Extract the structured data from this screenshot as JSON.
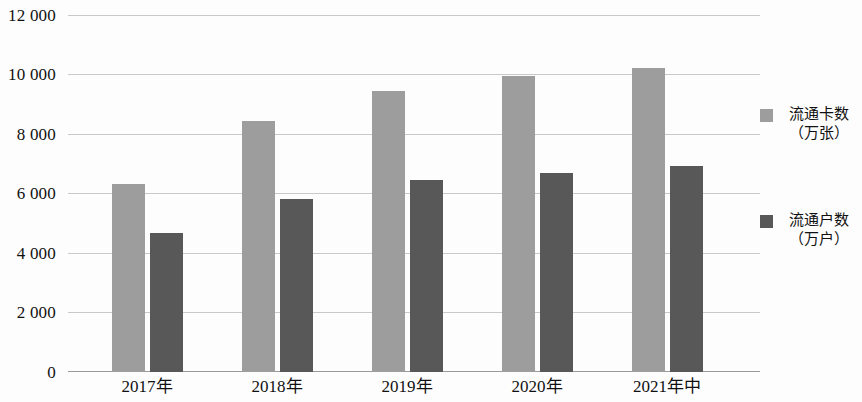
{
  "chart_data": {
    "type": "bar",
    "title": "",
    "subtitle": "",
    "xlabel": "",
    "ylabel": "",
    "categories": [
      "2017年",
      "2018年",
      "2019年",
      "2020年",
      "2021年中"
    ],
    "series": [
      {
        "name": "流通卡数（万张）",
        "name_line1": "流通卡数",
        "name_line2": "（万张）",
        "color": "#9d9d9d",
        "values": [
          6330,
          8470,
          9490,
          9990,
          10260
        ]
      },
      {
        "name": "流通户数（万户）",
        "name_line1": "流通户数",
        "name_line2": "（万户）",
        "color": "#585858",
        "values": [
          4690,
          5840,
          6470,
          6720,
          6940
        ]
      }
    ],
    "ylim": [
      0,
      12000
    ],
    "ytick_values": [
      12000,
      10000,
      8000,
      6000,
      4000,
      2000,
      0
    ],
    "ytick_labels": [
      "12 000",
      "10 000",
      "8 000",
      "6 000",
      "4 000",
      "2 000",
      "0"
    ],
    "grid": true,
    "grid_axis": "y",
    "legend_position": "right",
    "bar_group_count": 5,
    "background_color": "#fdfdfd",
    "gridline_color": "#c9c9c9",
    "axis_color": "#9a9a9a"
  }
}
